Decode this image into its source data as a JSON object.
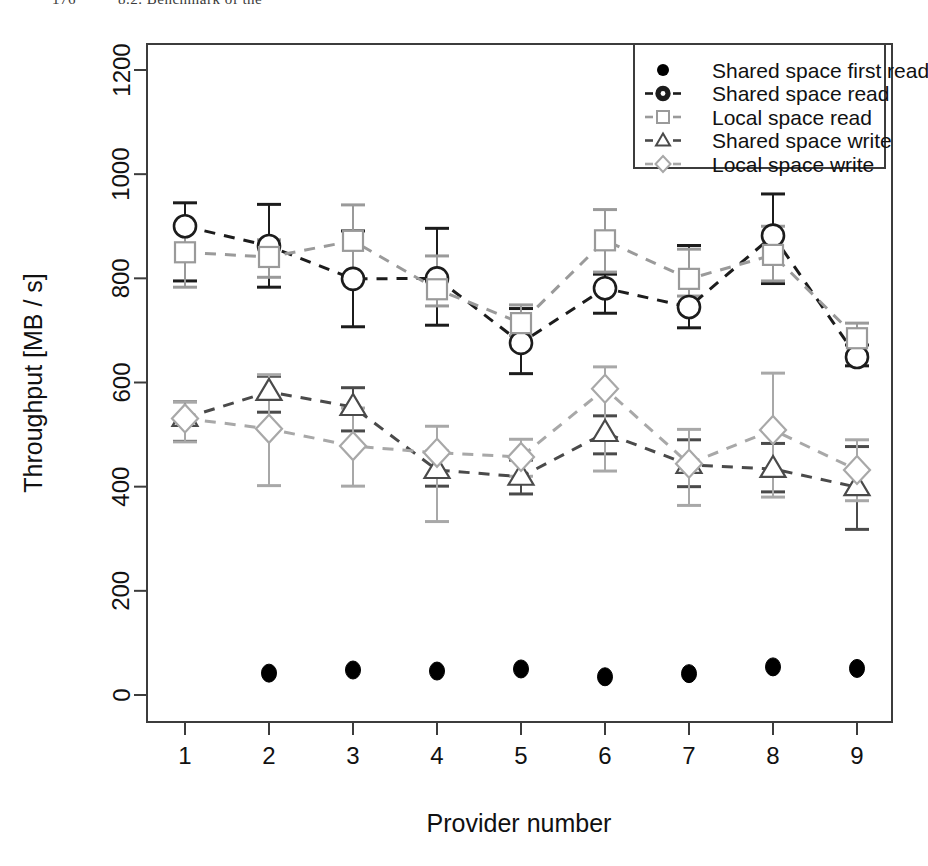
{
  "page_header": {
    "page_number": "176",
    "running_head": "8.2. Benchmark of the"
  },
  "chart_data": {
    "type": "line",
    "title": "",
    "xlabel": "Provider number",
    "ylabel": "Throughput [MB / s]",
    "categories": [
      "1",
      "2",
      "3",
      "4",
      "5",
      "6",
      "7",
      "8",
      "9"
    ],
    "x": [
      1,
      2,
      3,
      4,
      5,
      6,
      7,
      8,
      9
    ],
    "xlim": [
      0.55,
      9.45
    ],
    "ylim": [
      -30,
      1255
    ],
    "yticks": [
      0,
      200,
      400,
      600,
      800,
      1000,
      1200
    ],
    "ytick_labels": [
      "0",
      "200",
      "400",
      "600",
      "800",
      "1000",
      "1200"
    ],
    "grid": false,
    "legend_position": "top-right",
    "error_bars": true,
    "series": [
      {
        "name": "Shared space first read",
        "marker": "filled-circle",
        "line": "none",
        "color": "#000000",
        "values": [
          null,
          42,
          48,
          46,
          50,
          35,
          41,
          54,
          51
        ],
        "errors": [
          null,
          0,
          0,
          0,
          0,
          0,
          0,
          0,
          0
        ]
      },
      {
        "name": "Shared space read",
        "marker": "circle",
        "line": "dashed",
        "color": "#1c1c1c",
        "values": [
          900,
          862,
          799,
          800,
          676,
          781,
          745,
          882,
          649
        ],
        "err_low": [
          795,
          783,
          707,
          710,
          617,
          733,
          705,
          790,
          632
        ],
        "err_high": [
          945,
          942,
          891,
          896,
          742,
          808,
          863,
          962,
          672
        ]
      },
      {
        "name": "Local space read",
        "marker": "square",
        "line": "dashed",
        "color": "#9a9a9a",
        "values": [
          850,
          841,
          872,
          779,
          714,
          873,
          799,
          845,
          685
        ],
        "err_low": [
          783,
          802,
          803,
          747,
          690,
          812,
          766,
          795,
          655
        ],
        "err_high": [
          905,
          874,
          941,
          843,
          749,
          932,
          856,
          900,
          714
        ]
      },
      {
        "name": "Shared space write",
        "marker": "triangle",
        "line": "dashed",
        "color": "#4a4a4a",
        "values": [
          532,
          582,
          553,
          432,
          419,
          503,
          442,
          434,
          399
        ],
        "err_low": [
          487,
          543,
          507,
          401,
          386,
          463,
          400,
          390,
          318
        ],
        "err_high": [
          563,
          612,
          590,
          468,
          451,
          536,
          490,
          483,
          477
        ]
      },
      {
        "name": "Local space write",
        "marker": "diamond",
        "line": "dashed",
        "color": "#a8a8a8",
        "values": [
          531,
          511,
          478,
          465,
          457,
          588,
          444,
          509,
          432
        ],
        "err_low": [
          486,
          402,
          401,
          333,
          420,
          430,
          364,
          380,
          373
        ],
        "err_high": [
          563,
          615,
          551,
          516,
          491,
          630,
          510,
          618,
          490
        ]
      }
    ]
  },
  "legend": {
    "entries": [
      "Shared space first read",
      "Shared space read",
      "Local space read",
      "Shared space write",
      "Local space write"
    ]
  }
}
